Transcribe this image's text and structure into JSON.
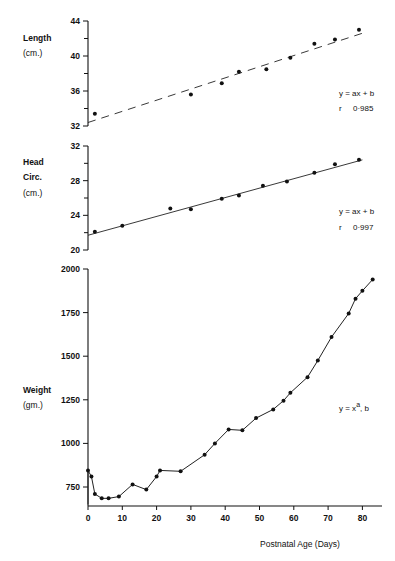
{
  "chart_data": [
    {
      "type": "scatter",
      "panel": "length",
      "ylabel_lines": [
        "Length",
        "(cm.)"
      ],
      "ylim": [
        32,
        44
      ],
      "yticks_major": [
        32,
        36,
        40,
        44
      ],
      "yticks_minor": [
        34,
        38,
        42
      ],
      "xlim": [
        0,
        85
      ],
      "points": [
        {
          "x": 2,
          "y": 33.4
        },
        {
          "x": 30,
          "y": 35.6
        },
        {
          "x": 39,
          "y": 36.9
        },
        {
          "x": 44,
          "y": 38.2
        },
        {
          "x": 52,
          "y": 38.5
        },
        {
          "x": 59,
          "y": 39.8
        },
        {
          "x": 66,
          "y": 41.4
        },
        {
          "x": 72,
          "y": 41.9
        },
        {
          "x": 79,
          "y": 43.0
        }
      ],
      "fit": {
        "style": "dashed",
        "x": [
          0,
          80
        ],
        "y": [
          32.4,
          42.6
        ]
      },
      "annotation": {
        "equation": "y = ax + b",
        "r_label": "r",
        "r_value": "0·985"
      },
      "grid": false
    },
    {
      "type": "scatter",
      "panel": "head_circumference",
      "ylabel_lines": [
        "Head",
        "Circ.",
        "(cm.)"
      ],
      "ylim": [
        20,
        32
      ],
      "yticks_major": [
        20,
        24,
        28,
        32
      ],
      "yticks_minor": [
        22,
        26,
        30
      ],
      "xlim": [
        0,
        85
      ],
      "points": [
        {
          "x": 2,
          "y": 22.1
        },
        {
          "x": 10,
          "y": 22.8
        },
        {
          "x": 24,
          "y": 24.8
        },
        {
          "x": 30,
          "y": 24.7
        },
        {
          "x": 39,
          "y": 25.9
        },
        {
          "x": 44,
          "y": 26.3
        },
        {
          "x": 51,
          "y": 27.4
        },
        {
          "x": 58,
          "y": 27.9
        },
        {
          "x": 66,
          "y": 28.9
        },
        {
          "x": 72,
          "y": 29.9
        },
        {
          "x": 79,
          "y": 30.4
        }
      ],
      "fit": {
        "style": "solid",
        "x": [
          0,
          80
        ],
        "y": [
          21.7,
          30.4
        ]
      },
      "annotation": {
        "equation": "y = ax + b",
        "r_label": "r",
        "r_value": "0·997"
      },
      "grid": false
    },
    {
      "type": "line",
      "panel": "weight",
      "ylabel_lines": [
        "Weight",
        "(gm.)"
      ],
      "ylim": [
        640,
        2000
      ],
      "yticks_major": [
        750,
        1000,
        1250,
        1500,
        1750,
        2000
      ],
      "xlim": [
        0,
        85
      ],
      "xticks": [
        0,
        10,
        20,
        30,
        40,
        50,
        60,
        70,
        80
      ],
      "xlabel": "Postnatal Age (Days)",
      "start_point": {
        "x": 0,
        "y": 650
      },
      "points": [
        {
          "x": 0,
          "y": 845
        },
        {
          "x": 1,
          "y": 810
        },
        {
          "x": 2,
          "y": 710
        },
        {
          "x": 4,
          "y": 685
        },
        {
          "x": 6,
          "y": 685
        },
        {
          "x": 9,
          "y": 695
        },
        {
          "x": 13,
          "y": 765
        },
        {
          "x": 17,
          "y": 735
        },
        {
          "x": 20,
          "y": 810
        },
        {
          "x": 21,
          "y": 845
        },
        {
          "x": 27,
          "y": 840
        },
        {
          "x": 34,
          "y": 935
        },
        {
          "x": 37,
          "y": 1000
        },
        {
          "x": 41,
          "y": 1080
        },
        {
          "x": 45,
          "y": 1075
        },
        {
          "x": 49,
          "y": 1145
        },
        {
          "x": 54,
          "y": 1195
        },
        {
          "x": 57,
          "y": 1245
        },
        {
          "x": 59,
          "y": 1290
        },
        {
          "x": 64,
          "y": 1380
        },
        {
          "x": 67,
          "y": 1475
        },
        {
          "x": 71,
          "y": 1610
        },
        {
          "x": 76,
          "y": 1745
        },
        {
          "x": 78,
          "y": 1830
        },
        {
          "x": 80,
          "y": 1875
        },
        {
          "x": 83,
          "y": 1940
        }
      ],
      "annotation": {
        "equation_prefix": "y = x",
        "equation_sup": "a",
        "equation_suffix": ", b"
      },
      "grid": false
    }
  ]
}
